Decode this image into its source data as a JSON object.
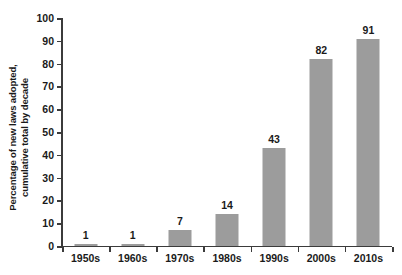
{
  "chart_data": {
    "type": "bar",
    "title": "",
    "xlabel": "",
    "ylabel_line1": "Percentage of new laws adopted,",
    "ylabel_line2": "cumulative total by decade",
    "categories": [
      "1950s",
      "1960s",
      "1970s",
      "1980s",
      "1990s",
      "2000s",
      "2010s"
    ],
    "values": [
      1,
      1,
      7,
      14,
      43,
      82,
      91
    ],
    "value_labels": [
      "1",
      "1",
      "7",
      "14",
      "43",
      "82",
      "91"
    ],
    "ylim": [
      0,
      100
    ],
    "ytick_step": 10,
    "ytick_labels": [
      "0",
      "10",
      "20",
      "30",
      "40",
      "50",
      "60",
      "70",
      "80",
      "90",
      "100"
    ],
    "grid": false,
    "legend": false,
    "bar_color": "#9c9c9c",
    "axis_color": "#3b3b3b",
    "text_color": "#1a1a1a",
    "background_color": "#ffffff"
  }
}
